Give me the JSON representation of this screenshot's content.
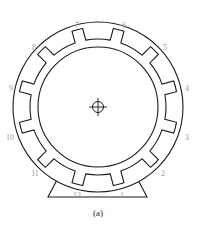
{
  "figure": {
    "caption": "(a)"
  },
  "colors": {
    "line": "#1a1a1a",
    "label": "#9a9a9a",
    "background": "#ffffff"
  },
  "geometry": {
    "center": [
      98,
      107
    ],
    "outer_radius": 85,
    "inner_radius": 60,
    "slot_ring_inner": 68,
    "slot_ring_outer": 80,
    "slot_count": 12
  },
  "slot_labels": [
    {
      "n": "1",
      "x": 122,
      "y": 198
    },
    {
      "n": "2",
      "x": 163,
      "y": 176
    },
    {
      "n": "3",
      "x": 187,
      "y": 140
    },
    {
      "n": "4",
      "x": 187,
      "y": 91
    },
    {
      "n": "5",
      "x": 165,
      "y": 50
    },
    {
      "n": "6",
      "x": 124,
      "y": 28
    },
    {
      "n": "7",
      "x": 77,
      "y": 28
    },
    {
      "n": "8",
      "x": 34,
      "y": 50
    },
    {
      "n": "9",
      "x": 11,
      "y": 91
    },
    {
      "n": "10",
      "x": 10,
      "y": 140
    },
    {
      "n": "11",
      "x": 35,
      "y": 176
    },
    {
      "n": "12",
      "x": 77,
      "y": 198
    }
  ]
}
